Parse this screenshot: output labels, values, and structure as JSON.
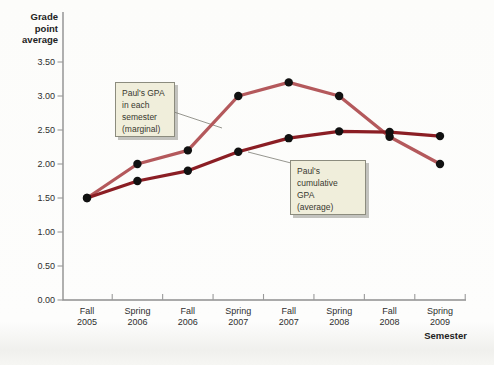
{
  "figure": {
    "y_axis_title_lines": [
      "Grade",
      "point",
      "average"
    ],
    "x_axis_title": "Semester"
  },
  "chart_data": {
    "type": "line",
    "title": "",
    "ylabel": "Grade point average",
    "xlabel": "Semester",
    "x_categories": [
      {
        "line1": "Fall",
        "line2": "2005"
      },
      {
        "line1": "Spring",
        "line2": "2006"
      },
      {
        "line1": "Fall",
        "line2": "2006"
      },
      {
        "line1": "Spring",
        "line2": "2007"
      },
      {
        "line1": "Fall",
        "line2": "2007"
      },
      {
        "line1": "Spring",
        "line2": "2008"
      },
      {
        "line1": "Fall",
        "line2": "2008"
      },
      {
        "line1": "Spring",
        "line2": "2009"
      }
    ],
    "y_tick_labels": [
      "0.00",
      "0.50",
      "1.00",
      "1.50",
      "2.00",
      "2.50",
      "3.00",
      "3.50"
    ],
    "y_tick_values": [
      0,
      0.5,
      1.0,
      1.5,
      2.0,
      2.5,
      3.0,
      3.5
    ],
    "ylim": [
      0,
      3.5
    ],
    "grid": "off",
    "legend_position": "callout-annotations",
    "series": [
      {
        "name": "Paul's GPA in each semester (marginal)",
        "color": "#b4595c",
        "values": [
          1.5,
          2.0,
          2.2,
          3.0,
          3.2,
          3.0,
          2.4,
          2.0
        ]
      },
      {
        "name": "Paul's cumulative GPA (average)",
        "color": "#8b1e24",
        "values": [
          1.5,
          1.75,
          1.9,
          2.18,
          2.38,
          2.48,
          2.47,
          2.41
        ]
      }
    ],
    "point_color": "#111111",
    "axis_color": "#8f8f8f"
  },
  "annotations": {
    "marginal_callout": {
      "lines": [
        "Paul's GPA",
        "in each",
        "semester",
        "(marginal)"
      ]
    },
    "average_callout": {
      "lines": [
        "Paul's",
        "cumulative",
        "GPA",
        "(average)"
      ]
    },
    "box_background": "#f0eedb",
    "box_border": "#8c8c7e"
  }
}
